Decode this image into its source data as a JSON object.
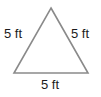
{
  "figure": {
    "shape_name": "equilateral-triangle",
    "stroke_color": "#8a8a8a",
    "fill_color": "#ffffff",
    "background_color": "#ffffff",
    "label_color": "#1c1c1c",
    "labels": {
      "left_side": "5 ft",
      "right_side": "5 ft",
      "bottom_side": "5 ft"
    },
    "geometry": {
      "apex": "51,8",
      "bottom_left": "14,73",
      "bottom_right": "88,73"
    }
  }
}
